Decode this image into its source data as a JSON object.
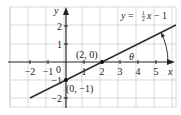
{
  "figure": {
    "equation": {
      "lhs": "y",
      "eq": " = ",
      "frac_num": "1",
      "frac_den": "2",
      "var": "x",
      "rest": " − 1"
    },
    "axes": {
      "x_label": "x",
      "y_label": "y",
      "origin_label": "0",
      "x_ticks": [
        {
          "value": -2,
          "label": "−2"
        },
        {
          "value": -1,
          "label": "−1"
        },
        {
          "value": 1,
          "label": "1"
        },
        {
          "value": 2,
          "label": "2"
        },
        {
          "value": 3,
          "label": "3"
        },
        {
          "value": 4,
          "label": "4"
        },
        {
          "value": 5,
          "label": "5"
        }
      ],
      "y_ticks": [
        {
          "value": 2,
          "label": "2"
        },
        {
          "value": 1,
          "label": "1"
        },
        {
          "value": -1,
          "label": "−1"
        },
        {
          "value": -2,
          "label": "−2"
        }
      ],
      "x_range": [
        -3,
        6
      ],
      "y_range": [
        -2.5,
        3
      ]
    },
    "points": [
      {
        "x": 2,
        "y": 0,
        "label": "(2, 0)"
      },
      {
        "x": 0,
        "y": -1,
        "label": "(0, −1)"
      }
    ],
    "angle_label": "θ",
    "colors": {
      "grid": "#c8c8c8",
      "axis": "#222222",
      "line": "#2a2a2a",
      "text": "#222222"
    }
  },
  "chart_data": {
    "type": "line",
    "xlabel": "x",
    "ylabel": "y",
    "x": [
      -2,
      0,
      2,
      4,
      6
    ],
    "series": [
      {
        "name": "y = ½x − 1",
        "values": [
          -2,
          -1,
          0,
          1,
          2
        ]
      }
    ],
    "annotations": [
      {
        "x": 2,
        "y": 0,
        "text": "(2, 0)"
      },
      {
        "x": 0,
        "y": -1,
        "text": "(0, −1)"
      },
      {
        "text": "θ",
        "note": "angle between line and positive x-axis"
      }
    ],
    "xlim": [
      -3,
      6
    ],
    "ylim": [
      -2.5,
      3
    ],
    "grid": true
  }
}
